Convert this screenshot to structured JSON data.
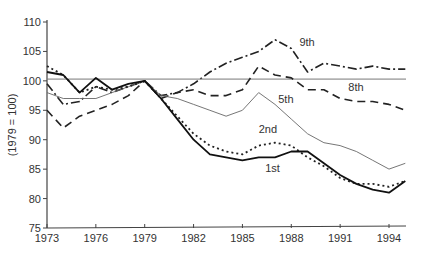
{
  "chart_data": {
    "type": "line",
    "title": "",
    "xlabel": "",
    "ylabel": "(1979 = 100)",
    "xlim": [
      1973,
      1995
    ],
    "ylim": [
      75,
      110
    ],
    "x_ticks": [
      "1973",
      "1976",
      "1979",
      "1982",
      "1985",
      "1988",
      "1991",
      "1994"
    ],
    "y_ticks": [
      "75",
      "80",
      "85",
      "90",
      "95",
      "100",
      "105",
      "110"
    ],
    "grid": false,
    "legend": "inline labels",
    "x": [
      1973,
      1974,
      1975,
      1976,
      1977,
      1978,
      1979,
      1980,
      1981,
      1982,
      1983,
      1984,
      1985,
      1986,
      1987,
      1988,
      1989,
      1990,
      1991,
      1992,
      1993,
      1994,
      1995
    ],
    "series": [
      {
        "name": "9th",
        "style": "dashdot",
        "values": [
          99.5,
          96,
          96.5,
          99,
          98,
          99,
          100,
          97.5,
          98,
          99.5,
          101.5,
          103,
          104,
          105,
          107,
          105.5,
          101.5,
          103,
          102.5,
          102,
          102.5,
          102,
          102
        ],
        "label_pos": [
          1988.5,
          106
        ]
      },
      {
        "name": "8th",
        "style": "thin-solid",
        "values": [
          100,
          100,
          100,
          100,
          100,
          100,
          100,
          100,
          100,
          100,
          100,
          100,
          100,
          100,
          100,
          100,
          100,
          100,
          100,
          100,
          100,
          100,
          100
        ],
        "label_pos": [
          1991.5,
          98.3
        ]
      },
      {
        "name": "5th",
        "style": "dashed",
        "values": [
          95,
          92,
          94,
          95,
          96,
          97.5,
          100,
          97,
          98,
          98.5,
          97.5,
          97.5,
          98.5,
          102.5,
          101,
          100.5,
          98.5,
          98.5,
          97,
          96.5,
          96.5,
          96,
          95
        ],
        "label_pos": [
          1987.2,
          96.3
        ]
      },
      {
        "name": "",
        "style": "thin-gray",
        "values": [
          98,
          97,
          97,
          97,
          98,
          99,
          100,
          97.5,
          97,
          96,
          95,
          94,
          95,
          98,
          96,
          93.5,
          91,
          89.5,
          89,
          88,
          86.5,
          85,
          86
        ]
      },
      {
        "name": "2nd",
        "style": "dotted",
        "values": [
          102.5,
          101,
          98,
          99,
          98.5,
          99,
          100,
          97,
          94,
          91,
          89,
          88,
          87.5,
          89,
          89.5,
          89,
          87,
          85.5,
          83.5,
          82.5,
          82.5,
          82,
          83
        ],
        "label_pos": [
          1986,
          91.2
        ]
      },
      {
        "name": "1st",
        "style": "solid",
        "values": [
          101.5,
          101,
          98,
          100.5,
          98.5,
          99.5,
          100,
          97,
          93.5,
          90,
          87.5,
          87,
          86.5,
          87,
          87,
          88,
          88,
          86,
          84,
          82.5,
          81.5,
          81,
          83
        ],
        "label_pos": [
          1986.4,
          84.5
        ]
      }
    ]
  }
}
